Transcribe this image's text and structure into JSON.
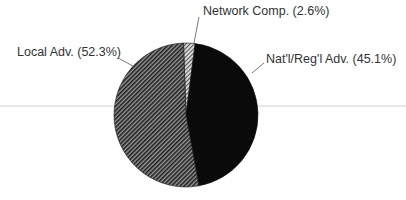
{
  "chart_data": {
    "type": "pie",
    "title": "",
    "categories": [
      "Network Comp.",
      "Nat'l/Reg'l Adv.",
      "Local Adv."
    ],
    "values": [
      2.6,
      45.1,
      52.3
    ],
    "unit": "%",
    "fills": [
      "light-hatch",
      "solid-black",
      "dark-hatch"
    ],
    "labels": [
      "Network Comp. (2.6%)",
      "Nat'l/Reg'l Adv. (45.1%)",
      "Local Adv. (52.3%)"
    ],
    "legend": "none (leader-line labels)",
    "start_angle_deg": 0,
    "direction": "clockwise"
  },
  "colors": {
    "background": "#ffffff",
    "solid": "#0a0a0a",
    "hatch_dark": "#2a2a2a",
    "hatch_light": "#bdbdbd",
    "text": "#333333"
  }
}
